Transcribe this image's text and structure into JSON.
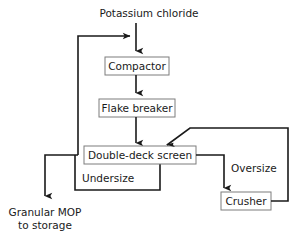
{
  "diagram": {
    "background_color": "#ffffff",
    "line_color": "#1a1a1a",
    "box_border_color": "#7d7d7d",
    "text_color": "#1a1a1a"
  },
  "feed": {
    "label": "Potassium chloride"
  },
  "units": [
    {
      "id": "compactor",
      "label": "Compactor"
    },
    {
      "id": "flake-breaker",
      "label": "Flake breaker"
    },
    {
      "id": "double-deck-screen",
      "label": "Double-deck screen"
    },
    {
      "id": "crusher",
      "label": "Crusher"
    }
  ],
  "streams": [
    {
      "id": "undersize",
      "label": "Undersize"
    },
    {
      "id": "oversize",
      "label": "Oversize"
    }
  ],
  "product": {
    "line1": "Granular MOP",
    "line2": "to storage"
  }
}
